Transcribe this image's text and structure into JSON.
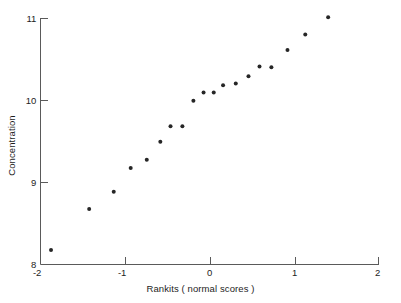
{
  "chart_data": {
    "type": "scatter",
    "title": "",
    "xlabel": "Rankits ( normal scores )",
    "ylabel": "Concentration",
    "xlim": [
      -2,
      2
    ],
    "ylim": [
      8,
      11
    ],
    "grid": false,
    "legend": null,
    "xticks": [
      -2,
      -1,
      0,
      1,
      2
    ],
    "xticklabels": [
      "-2",
      "-1",
      "0",
      "1",
      "2"
    ],
    "yticks": [
      8,
      9,
      10,
      11
    ],
    "yticklabels": [
      "8",
      "9",
      "10",
      "11"
    ],
    "marker": "filled-circle",
    "marker_color": "#262626",
    "marker_size_px": 4,
    "axis_color": "#5a5a5a",
    "background": "#ffffff",
    "n_points": 19,
    "points": [
      {
        "x": -1.87,
        "y": 8.17
      },
      {
        "x": -1.42,
        "y": 8.67
      },
      {
        "x": -1.13,
        "y": 8.88
      },
      {
        "x": -0.93,
        "y": 9.17
      },
      {
        "x": -0.74,
        "y": 9.27
      },
      {
        "x": -0.58,
        "y": 9.49
      },
      {
        "x": -0.46,
        "y": 9.68
      },
      {
        "x": -0.32,
        "y": 9.68
      },
      {
        "x": -0.19,
        "y": 9.99
      },
      {
        "x": -0.07,
        "y": 10.09
      },
      {
        "x": 0.05,
        "y": 10.09
      },
      {
        "x": 0.16,
        "y": 10.18
      },
      {
        "x": 0.31,
        "y": 10.2
      },
      {
        "x": 0.46,
        "y": 10.29
      },
      {
        "x": 0.59,
        "y": 10.41
      },
      {
        "x": 0.73,
        "y": 10.4
      },
      {
        "x": 0.92,
        "y": 10.61
      },
      {
        "x": 1.13,
        "y": 10.8
      },
      {
        "x": 1.4,
        "y": 11.01
      }
    ],
    "x": [
      -1.87,
      -1.42,
      -1.13,
      -0.93,
      -0.74,
      -0.58,
      -0.46,
      -0.32,
      -0.19,
      -0.07,
      0.05,
      0.16,
      0.31,
      0.46,
      0.59,
      0.73,
      0.92,
      1.13,
      1.4
    ],
    "y": [
      8.17,
      8.67,
      8.88,
      9.17,
      9.27,
      9.49,
      9.68,
      9.68,
      9.99,
      10.09,
      10.09,
      10.18,
      10.2,
      10.29,
      10.41,
      10.4,
      10.61,
      10.8,
      11.01
    ]
  },
  "axes": {
    "x_title": "Rankits ( normal scores )",
    "y_title": "Concentration",
    "x_tick_labels": [
      "-2",
      "-1",
      "0",
      "1",
      "2"
    ],
    "y_tick_labels": [
      "11",
      "10",
      "9",
      "8"
    ]
  }
}
